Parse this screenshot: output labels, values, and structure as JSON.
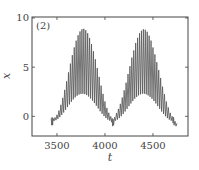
{
  "chart_data": {
    "type": "line",
    "title": "",
    "panel_label": "(2)",
    "xlabel": "t",
    "ylabel": "x",
    "xlim": [
      3240,
      4865
    ],
    "ylim": [
      -2.0,
      10.1
    ],
    "xticks": [
      3500,
      4000,
      4500
    ],
    "xtick_labels": [
      "3500",
      "4000",
      "4500"
    ],
    "yticks": [
      0,
      5,
      10
    ],
    "ytick_labels": [
      "0",
      "5",
      "10"
    ],
    "grid": false,
    "legend": null,
    "line_color": "#555555",
    "series": [
      {
        "name": "x(t)",
        "points": [
          [
            3440,
            -0.2
          ],
          [
            3445,
            -0.9
          ],
          [
            3450,
            -0.1
          ],
          [
            3455,
            -0.9
          ],
          [
            3460,
            -0.2
          ],
          [
            3470,
            -0.47
          ],
          [
            3480,
            -0.11
          ],
          [
            3490,
            -0.39
          ],
          [
            3500,
            0.15
          ],
          [
            3510,
            -0.26
          ],
          [
            3520,
            0.58
          ],
          [
            3530,
            -0.08
          ],
          [
            3540,
            1.17
          ],
          [
            3550,
            0.14
          ],
          [
            3560,
            1.88
          ],
          [
            3570,
            0.39
          ],
          [
            3580,
            2.69
          ],
          [
            3590,
            0.66
          ],
          [
            3600,
            3.56
          ],
          [
            3610,
            0.94
          ],
          [
            3620,
            4.47
          ],
          [
            3630,
            1.21
          ],
          [
            3640,
            5.36
          ],
          [
            3650,
            1.48
          ],
          [
            3660,
            6.22
          ],
          [
            3670,
            1.72
          ],
          [
            3680,
            7.01
          ],
          [
            3690,
            1.93
          ],
          [
            3700,
            7.69
          ],
          [
            3710,
            2.1
          ],
          [
            3720,
            8.24
          ],
          [
            3730,
            2.22
          ],
          [
            3740,
            8.63
          ],
          [
            3750,
            2.28
          ],
          [
            3760,
            8.85
          ],
          [
            3770,
            2.3
          ],
          [
            3780,
            8.9
          ],
          [
            3790,
            2.26
          ],
          [
            3800,
            8.75
          ],
          [
            3810,
            2.16
          ],
          [
            3820,
            8.45
          ],
          [
            3830,
            2.01
          ],
          [
            3840,
            7.97
          ],
          [
            3850,
            1.82
          ],
          [
            3860,
            7.35
          ],
          [
            3870,
            1.6
          ],
          [
            3880,
            6.62
          ],
          [
            3890,
            1.35
          ],
          [
            3900,
            5.8
          ],
          [
            3910,
            1.08
          ],
          [
            3920,
            4.92
          ],
          [
            3930,
            0.8
          ],
          [
            3940,
            4.01
          ],
          [
            3950,
            0.52
          ],
          [
            3960,
            3.12
          ],
          [
            3970,
            0.26
          ],
          [
            3980,
            2.28
          ],
          [
            3990,
            0.03
          ],
          [
            4000,
            1.52
          ],
          [
            4010,
            -0.17
          ],
          [
            4020,
            0.86
          ],
          [
            4030,
            -0.33
          ],
          [
            4040,
            0.36
          ],
          [
            4050,
            -0.44
          ],
          [
            4060,
            0.0
          ],
          [
            4070,
            -0.6
          ],
          [
            4075,
            -0.2
          ],
          [
            4080,
            -1.0
          ],
          [
            4085,
            -0.3
          ],
          [
            4090,
            -0.9
          ],
          [
            4100,
            -0.1
          ],
          [
            4110,
            -0.44
          ],
          [
            4120,
            0.34
          ],
          [
            4130,
            -0.33
          ],
          [
            4140,
            0.75
          ],
          [
            4150,
            -0.18
          ],
          [
            4160,
            1.27
          ],
          [
            4170,
            0.01
          ],
          [
            4180,
            1.91
          ],
          [
            4190,
            0.24
          ],
          [
            4200,
            2.64
          ],
          [
            4210,
            0.49
          ],
          [
            4220,
            3.42
          ],
          [
            4230,
            0.76
          ],
          [
            4240,
            4.3
          ],
          [
            4250,
            1.04
          ],
          [
            4260,
            5.1
          ],
          [
            4270,
            1.31
          ],
          [
            4280,
            5.97
          ],
          [
            4290,
            1.56
          ],
          [
            4300,
            6.7
          ],
          [
            4310,
            1.79
          ],
          [
            4320,
            7.46
          ],
          [
            4330,
            1.98
          ],
          [
            4340,
            7.98
          ],
          [
            4350,
            2.13
          ],
          [
            4360,
            8.46
          ],
          [
            4370,
            2.24
          ],
          [
            4380,
            8.7
          ],
          [
            4390,
            2.3
          ],
          [
            4400,
            8.85
          ],
          [
            4410,
            2.3
          ],
          [
            4420,
            8.8
          ],
          [
            4430,
            2.24
          ],
          [
            4440,
            8.6
          ],
          [
            4450,
            2.13
          ],
          [
            4460,
            8.2
          ],
          [
            4470,
            1.98
          ],
          [
            4480,
            7.7
          ],
          [
            4490,
            1.79
          ],
          [
            4500,
            7.0
          ],
          [
            4510,
            1.56
          ],
          [
            4520,
            6.3
          ],
          [
            4530,
            1.31
          ],
          [
            4540,
            5.5
          ],
          [
            4550,
            1.04
          ],
          [
            4560,
            4.7
          ],
          [
            4570,
            0.76
          ],
          [
            4580,
            3.9
          ],
          [
            4590,
            0.49
          ],
          [
            4600,
            3.02
          ],
          [
            4610,
            0.24
          ],
          [
            4620,
            2.25
          ],
          [
            4630,
            0.01
          ],
          [
            4640,
            1.5
          ],
          [
            4650,
            -0.18
          ],
          [
            4660,
            0.9
          ],
          [
            4670,
            -0.33
          ],
          [
            4680,
            0.35
          ],
          [
            4690,
            -0.44
          ],
          [
            4700,
            0.0
          ],
          [
            4710,
            -0.7
          ],
          [
            4715,
            -0.1
          ],
          [
            4720,
            -0.9
          ],
          [
            4730,
            -0.5
          ],
          [
            4740,
            -1.0
          ],
          [
            4750,
            -0.7
          ]
        ]
      }
    ]
  }
}
